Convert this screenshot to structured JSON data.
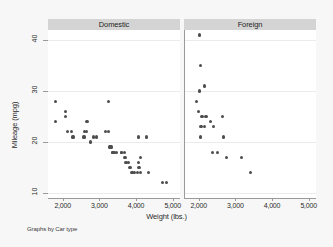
{
  "chart_data": {
    "type": "scatter",
    "title": "",
    "xlabel": "Weight (lbs.)",
    "ylabel": "Mileage (mpg)",
    "footnote": "Graphs by Car type",
    "xlim": [
      1600,
      5200
    ],
    "ylim": [
      9,
      42
    ],
    "xticks": [
      2000,
      3000,
      4000,
      5000
    ],
    "xticklabels": [
      "2,000",
      "3,000",
      "4,000",
      "5,000"
    ],
    "yticks": [
      10,
      20,
      30,
      40
    ],
    "yticklabels": [
      "10",
      "20",
      "30",
      "40"
    ],
    "grid": "horizontal",
    "legend": "none",
    "facet_by": "Car type",
    "panels": [
      {
        "label": "Domestic",
        "points": [
          [
            1800,
            28
          ],
          [
            1800,
            24
          ],
          [
            2070,
            26
          ],
          [
            2070,
            25
          ],
          [
            2130,
            22
          ],
          [
            2230,
            22
          ],
          [
            2280,
            21
          ],
          [
            2580,
            21
          ],
          [
            2600,
            22
          ],
          [
            2640,
            22
          ],
          [
            2650,
            24
          ],
          [
            2670,
            24
          ],
          [
            2750,
            20
          ],
          [
            2830,
            21
          ],
          [
            2930,
            21
          ],
          [
            3170,
            22
          ],
          [
            3250,
            28
          ],
          [
            3260,
            22
          ],
          [
            3280,
            19
          ],
          [
            3300,
            19
          ],
          [
            3310,
            19
          ],
          [
            3330,
            19
          ],
          [
            3350,
            18
          ],
          [
            3370,
            18
          ],
          [
            3380,
            18
          ],
          [
            3420,
            18
          ],
          [
            3470,
            18
          ],
          [
            3600,
            18
          ],
          [
            3600,
            18
          ],
          [
            3690,
            18
          ],
          [
            3700,
            17
          ],
          [
            3720,
            16
          ],
          [
            3740,
            16
          ],
          [
            3790,
            16
          ],
          [
            3830,
            15
          ],
          [
            3850,
            15
          ],
          [
            3880,
            14
          ],
          [
            3900,
            14
          ],
          [
            3900,
            14
          ],
          [
            3960,
            14
          ],
          [
            4030,
            14
          ],
          [
            4060,
            21
          ],
          [
            4060,
            16
          ],
          [
            4080,
            15
          ],
          [
            4130,
            14
          ],
          [
            4130,
            17
          ],
          [
            4290,
            21
          ],
          [
            4330,
            14
          ],
          [
            4720,
            12
          ],
          [
            4840,
            12
          ]
        ]
      },
      {
        "label": "Foreign",
        "points": [
          [
            2020,
            41
          ],
          [
            2050,
            35
          ],
          [
            2150,
            31
          ],
          [
            2020,
            30
          ],
          [
            1930,
            28
          ],
          [
            1990,
            26
          ],
          [
            2070,
            25
          ],
          [
            2100,
            25
          ],
          [
            2200,
            25
          ],
          [
            2320,
            24
          ],
          [
            2650,
            25
          ],
          [
            2040,
            23
          ],
          [
            2070,
            23
          ],
          [
            2160,
            23
          ],
          [
            2410,
            23
          ],
          [
            2050,
            21
          ],
          [
            2670,
            21
          ],
          [
            2370,
            18
          ],
          [
            2520,
            18
          ],
          [
            2750,
            17
          ],
          [
            3170,
            17
          ],
          [
            3420,
            14
          ]
        ]
      }
    ]
  }
}
